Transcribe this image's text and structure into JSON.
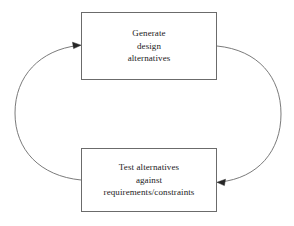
{
  "diagram": {
    "type": "cycle-flowchart",
    "canvas": {
      "width": 294,
      "height": 226,
      "background": "#ffffff"
    },
    "stroke_color": "#6b6b6b",
    "text_color": "#1a1a1a",
    "nodes": [
      {
        "id": "generate",
        "shape": "rectangle",
        "x": 81,
        "y": 12,
        "width": 136,
        "height": 68,
        "lines": [
          "Generate",
          "design",
          "alternatives"
        ]
      },
      {
        "id": "test",
        "shape": "rectangle",
        "x": 81,
        "y": 148,
        "width": 136,
        "height": 64,
        "lines": [
          "Test alternatives",
          "against",
          "requirements/constraints"
        ]
      }
    ],
    "edges": [
      {
        "id": "test-to-generate",
        "from": "test",
        "to": "generate",
        "side": "left",
        "style": "curved-arc",
        "arrowhead": "end",
        "direction": "right"
      },
      {
        "id": "generate-to-test",
        "from": "generate",
        "to": "test",
        "side": "right",
        "style": "curved-arc",
        "arrowhead": "end",
        "direction": "left"
      }
    ]
  }
}
